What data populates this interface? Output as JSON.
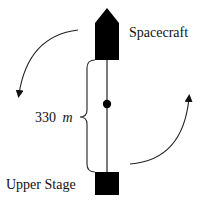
{
  "diagram": {
    "labels": {
      "spacecraft": "Spacecraft",
      "upper_stage": "Upper Stage",
      "length_value": "330",
      "length_unit": "m"
    },
    "colors": {
      "ink": "#000000",
      "text": "#111111",
      "line": "#333333",
      "background": "#ffffff"
    }
  }
}
